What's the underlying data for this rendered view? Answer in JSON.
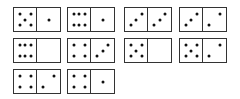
{
  "dominoes": [
    {
      "left": 5,
      "right": 1
    },
    {
      "left": 6,
      "right": 1
    },
    {
      "left": 3,
      "right": 3
    },
    {
      "left": 3,
      "right": 2
    },
    {
      "left": 6,
      "right": 0
    },
    {
      "left": 4,
      "right": 3
    },
    {
      "left": 5,
      "right": 0
    },
    {
      "left": 5,
      "right": 2
    },
    {
      "left": 4,
      "right": 2
    },
    {
      "left": 4,
      "right": 1
    }
  ],
  "colors": {
    "pip": "#111111",
    "border": "#333333",
    "face": "#ffffff"
  }
}
